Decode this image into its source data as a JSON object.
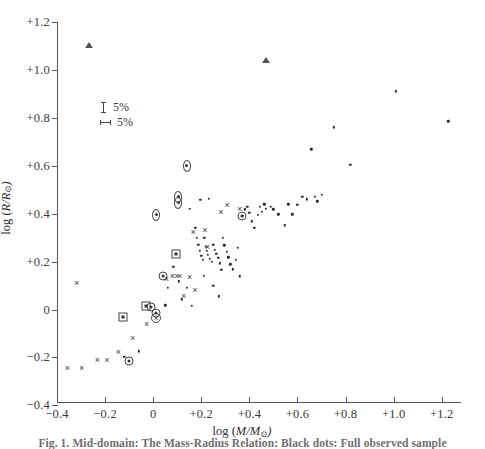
{
  "figure": {
    "caption": "Fig. 1. Mid-domain: The Mass-Radius Relation: Black dots: Full observed sample"
  },
  "legend": {
    "items": [
      {
        "icon": "vertical-errorbar-icon",
        "label": "5%"
      },
      {
        "icon": "horizontal-errorbar-icon",
        "label": "5%"
      }
    ]
  },
  "axes": {
    "x": {
      "title_prefix": "log  (",
      "title_var": "M/M",
      "title_sun": "⊙",
      "title_suffix": ")",
      "ticks": [
        "−0.4",
        "−0.2",
        "0",
        "+0.2",
        "+0.4",
        "+0.6",
        "+0.8",
        "+1.0",
        "+1.2"
      ],
      "tick_values": [
        -0.4,
        -0.2,
        0,
        0.2,
        0.4,
        0.6,
        0.8,
        1.0,
        1.2
      ],
      "min": -0.4,
      "max": 1.28
    },
    "y": {
      "title_prefix": "log (",
      "title_var": "R/R",
      "title_sun": "⊙",
      "title_suffix": ")",
      "ticks": [
        "+1.2",
        "+1.0",
        "+0.8",
        "+0.6",
        "+0.4",
        "+0.2",
        "0",
        "−0.2",
        "−0.4"
      ],
      "tick_values": [
        1.2,
        1.0,
        0.8,
        0.6,
        0.4,
        0.2,
        0,
        -0.2,
        -0.4
      ],
      "min": -0.39,
      "max": 1.2
    }
  },
  "chart_data": {
    "type": "scatter",
    "title": "",
    "xlabel": "log (M/M⊙)",
    "ylabel": "log (R/R⊙)",
    "xlim": [
      -0.4,
      1.28
    ],
    "ylim": [
      -0.39,
      1.2
    ],
    "grid": false,
    "legend_position": "upper-left-inside",
    "series": [
      {
        "name": "triangle",
        "marker": "triangle",
        "points": [
          [
            -0.266,
            1.102
          ],
          [
            0.47,
            1.043
          ]
        ]
      },
      {
        "name": "diamond",
        "marker": "diamond",
        "points": [
          [
            0.139,
            0.6
          ],
          [
            0.104,
            0.445
          ],
          [
            0.104,
            0.471
          ],
          [
            0.012,
            0.396
          ]
        ]
      },
      {
        "name": "open-circle",
        "marker": "open-circle",
        "points": [
          [
            0.013,
            -0.034
          ]
        ]
      },
      {
        "name": "circled-dot",
        "marker": "circled-dot",
        "points": [
          [
            0.012,
            -0.016
          ],
          [
            -0.01,
            0.012
          ],
          [
            0.042,
            0.14
          ],
          [
            -0.102,
            -0.216
          ],
          [
            0.37,
            0.39
          ]
        ]
      },
      {
        "name": "square-dot",
        "marker": "square-dot",
        "points": [
          [
            -0.03,
            0.013
          ],
          [
            -0.125,
            -0.03
          ],
          [
            0.096,
            0.233
          ]
        ]
      },
      {
        "name": "cross",
        "marker": "cross",
        "points": [
          [
            -0.318,
            0.11
          ],
          [
            -0.357,
            -0.243
          ],
          [
            -0.298,
            -0.243
          ],
          [
            -0.232,
            -0.211
          ],
          [
            -0.193,
            -0.211
          ],
          [
            -0.145,
            -0.176
          ],
          [
            -0.085,
            -0.12
          ],
          [
            -0.027,
            -0.062
          ],
          [
            0.012,
            -0.037
          ],
          [
            0.055,
            0.127
          ],
          [
            0.08,
            0.14
          ],
          [
            0.098,
            0.14
          ],
          [
            0.11,
            0.138
          ],
          [
            0.127,
            0.055
          ],
          [
            0.152,
            0.135
          ],
          [
            0.166,
            0.325
          ],
          [
            0.173,
            0.082
          ],
          [
            0.215,
            0.33
          ],
          [
            0.225,
            0.262
          ],
          [
            0.282,
            0.408
          ],
          [
            0.307,
            0.435
          ],
          [
            0.36,
            0.418
          ]
        ]
      },
      {
        "name": "dot",
        "marker": "dot",
        "points": [
          [
            0.153,
            0.42
          ],
          [
            0.175,
            0.342
          ],
          [
            0.182,
            0.3
          ],
          [
            0.188,
            0.27
          ],
          [
            0.194,
            0.245
          ],
          [
            0.2,
            0.225
          ],
          [
            0.207,
            0.207
          ],
          [
            0.212,
            0.3
          ],
          [
            0.218,
            0.262
          ],
          [
            0.222,
            0.245
          ],
          [
            0.228,
            0.228
          ],
          [
            0.236,
            0.213
          ],
          [
            0.243,
            0.198
          ],
          [
            0.25,
            0.27
          ],
          [
            0.256,
            0.25
          ],
          [
            0.262,
            0.232
          ],
          [
            0.27,
            0.215
          ],
          [
            0.277,
            0.193
          ],
          [
            0.283,
            0.165
          ],
          [
            0.29,
            0.3
          ],
          [
            0.296,
            0.268
          ],
          [
            0.305,
            0.24
          ],
          [
            0.312,
            0.218
          ],
          [
            0.32,
            0.188
          ],
          [
            0.33,
            0.168
          ],
          [
            0.343,
            0.207
          ],
          [
            0.352,
            0.258
          ],
          [
            0.36,
            0.138
          ],
          [
            0.372,
            0.39
          ],
          [
            0.382,
            0.418
          ],
          [
            0.392,
            0.43
          ],
          [
            0.4,
            0.405
          ],
          [
            0.41,
            0.368
          ],
          [
            0.42,
            0.34
          ],
          [
            0.434,
            0.395
          ],
          [
            0.443,
            0.43
          ],
          [
            0.452,
            0.408
          ],
          [
            0.462,
            0.44
          ],
          [
            0.468,
            0.42
          ],
          [
            0.488,
            0.43
          ],
          [
            0.5,
            0.418
          ],
          [
            0.52,
            0.398
          ],
          [
            0.548,
            0.352
          ],
          [
            0.562,
            0.44
          ],
          [
            0.578,
            0.398
          ],
          [
            0.6,
            0.437
          ],
          [
            0.62,
            0.47
          ],
          [
            0.64,
            0.46
          ],
          [
            0.658,
            0.668
          ],
          [
            0.672,
            0.47
          ],
          [
            0.682,
            0.452
          ],
          [
            0.7,
            0.48
          ],
          [
            0.752,
            0.76
          ],
          [
            0.82,
            0.605
          ],
          [
            1.01,
            0.91
          ],
          [
            1.228,
            0.785
          ],
          [
            0.106,
            0.118
          ],
          [
            0.06,
            0.09
          ],
          [
            0.14,
            0.092
          ],
          [
            0.21,
            0.14
          ],
          [
            0.25,
            0.1
          ],
          [
            0.12,
            0.042
          ],
          [
            0.16,
            0.015
          ],
          [
            0.272,
            0.055
          ],
          [
            0.083,
            0.178
          ],
          [
            0.05,
            0.018
          ],
          [
            -0.06,
            -0.175
          ],
          [
            -0.12,
            -0.196
          ],
          [
            0.196,
            0.458
          ],
          [
            0.232,
            0.462
          ]
        ]
      }
    ]
  }
}
